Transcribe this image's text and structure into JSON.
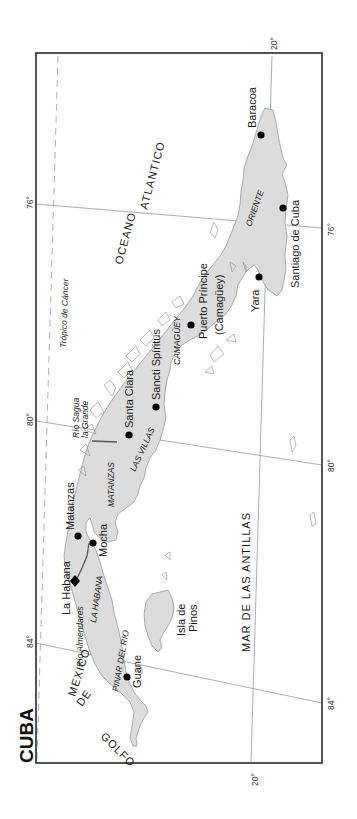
{
  "map": {
    "title": "CUBA",
    "colors": {
      "land": "#dcdcdc",
      "coast": "#8c8c8c",
      "frame": "#2a2a2a",
      "grid": "#8a8a8a",
      "text": "#1a1a1a"
    },
    "graticule": {
      "latitude_labels": [
        "20°",
        "20°"
      ],
      "longitude_labels": [
        "76°",
        "76°",
        "80°",
        "80°",
        "84°",
        "84°"
      ],
      "tropic_label": "Trópico de Cáncer"
    },
    "seas": {
      "ocean_word1": "OCEANO",
      "ocean_word2": "ATLANTICO",
      "caribbean": "MAR   DE   LAS   ANTILLAS",
      "gulf_1": "GOLFO",
      "gulf_2": "DE",
      "gulf_3": "MEXICO"
    },
    "provinces": {
      "oriente": "ORIENTE",
      "camaguey": "CAMAGÜEY",
      "las_villas": "LAS VILLAS",
      "matanzas": "MATANZAS",
      "la_habana": "LA HABANA",
      "pinar_del_rio": "PINAR DEL RIO"
    },
    "cities": {
      "baracoa": "Baracoa",
      "santiago": "Santiago de Cuba",
      "yara": "Yara",
      "puerto_principe_1": "Puerto Príncipe",
      "puerto_principe_2": "(Camagüey)",
      "sancti_spiritus": "Sancti Spíritus",
      "santa_clara": "Santa Clara",
      "matanzas": "Matanzas",
      "mocha": "Mocha",
      "la_habana": "La Habana",
      "guane": "Guane"
    },
    "islands": {
      "isla_de_pinos_1": "Isla de",
      "isla_de_pinos_2": "Pinos"
    },
    "rivers": {
      "sagua_1": "Río Sagua",
      "sagua_2": "la Grande",
      "almendares": "Río Almendares"
    }
  }
}
